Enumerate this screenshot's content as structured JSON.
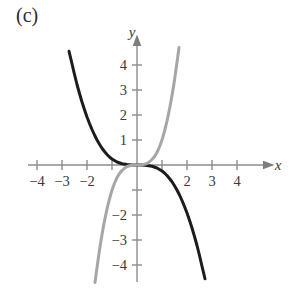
{
  "figure": {
    "panel_label": "(c)",
    "background_color": "#ffffff"
  },
  "chart_data": {
    "type": "line",
    "title": "(c)",
    "xlabel": "x",
    "ylabel": "y",
    "xlim": [
      -4.8,
      5.0
    ],
    "ylim": [
      -4.8,
      4.8
    ],
    "grid": false,
    "legend": null,
    "axes": {
      "x_axis_label": "x",
      "y_axis_label": "y",
      "x_ticks": [
        -4,
        -3,
        -2,
        -1,
        1,
        2,
        3,
        4
      ],
      "x_tick_labels": [
        "-4",
        "-3",
        "-2",
        "",
        "",
        "2",
        "3",
        "4"
      ],
      "x_tick_labels_shown": [
        "-4",
        "-3",
        "-2",
        "2",
        "3",
        "4"
      ],
      "y_ticks": [
        -4,
        -3,
        -2,
        -1,
        1,
        2,
        3,
        4
      ],
      "y_tick_labels": [
        "-4",
        "-3",
        "-2",
        "",
        "1",
        "2",
        "3",
        "4"
      ],
      "y_tick_labels_shown": [
        "1",
        "2",
        "3",
        "4",
        "-2",
        "-3",
        "-4"
      ],
      "x_arrow": true,
      "y_arrow": true,
      "units_per_tick": 1,
      "pixels_per_unit": 25,
      "origin_px": [
        137,
        165
      ]
    },
    "series": [
      {
        "name": "black-curve",
        "color": "#1c1c1c",
        "linewidth": 3.0,
        "description": "decreasing odd-degree curve, flat near origin, falls from upper-left to lower-right",
        "points": [
          [
            -2.72,
            4.55
          ],
          [
            -2.6,
            4.05
          ],
          [
            -2.5,
            3.62
          ],
          [
            -2.4,
            3.22
          ],
          [
            -2.3,
            2.86
          ],
          [
            -2.2,
            2.52
          ],
          [
            -2.1,
            2.21
          ],
          [
            -2.0,
            1.92
          ],
          [
            -1.9,
            1.66
          ],
          [
            -1.8,
            1.42
          ],
          [
            -1.7,
            1.2
          ],
          [
            -1.6,
            1.0
          ],
          [
            -1.5,
            0.83
          ],
          [
            -1.4,
            0.67
          ],
          [
            -1.3,
            0.54
          ],
          [
            -1.2,
            0.42
          ],
          [
            -1.1,
            0.32
          ],
          [
            -1.0,
            0.24
          ],
          [
            -0.9,
            0.18
          ],
          [
            -0.8,
            0.12
          ],
          [
            -0.6,
            0.05
          ],
          [
            -0.4,
            0.02
          ],
          [
            -0.2,
            0.0
          ],
          [
            0.0,
            0.0
          ],
          [
            0.2,
            0.0
          ],
          [
            0.4,
            -0.02
          ],
          [
            0.6,
            -0.05
          ],
          [
            0.8,
            -0.12
          ],
          [
            0.9,
            -0.18
          ],
          [
            1.0,
            -0.24
          ],
          [
            1.1,
            -0.32
          ],
          [
            1.2,
            -0.42
          ],
          [
            1.3,
            -0.54
          ],
          [
            1.4,
            -0.67
          ],
          [
            1.5,
            -0.83
          ],
          [
            1.6,
            -1.0
          ],
          [
            1.7,
            -1.2
          ],
          [
            1.8,
            -1.42
          ],
          [
            1.9,
            -1.66
          ],
          [
            2.0,
            -1.92
          ],
          [
            2.1,
            -2.21
          ],
          [
            2.2,
            -2.52
          ],
          [
            2.3,
            -2.86
          ],
          [
            2.4,
            -3.22
          ],
          [
            2.5,
            -3.62
          ],
          [
            2.6,
            -4.05
          ],
          [
            2.72,
            -4.55
          ]
        ]
      },
      {
        "name": "gray-curve",
        "color": "#a6a6a6",
        "linewidth": 3.0,
        "description": "increasing steep odd-degree curve through origin, rises from lower-left to upper-right",
        "points": [
          [
            -1.68,
            -4.7
          ],
          [
            -1.62,
            -4.25
          ],
          [
            -1.56,
            -3.82
          ],
          [
            -1.5,
            -3.4
          ],
          [
            -1.44,
            -3.02
          ],
          [
            -1.38,
            -2.67
          ],
          [
            -1.32,
            -2.34
          ],
          [
            -1.26,
            -2.04
          ],
          [
            -1.2,
            -1.76
          ],
          [
            -1.14,
            -1.51
          ],
          [
            -1.08,
            -1.28
          ],
          [
            -1.02,
            -1.07
          ],
          [
            -0.96,
            -0.89
          ],
          [
            -0.9,
            -0.73
          ],
          [
            -0.84,
            -0.59
          ],
          [
            -0.78,
            -0.47
          ],
          [
            -0.72,
            -0.37
          ],
          [
            -0.66,
            -0.29
          ],
          [
            -0.6,
            -0.22
          ],
          [
            -0.5,
            -0.13
          ],
          [
            -0.4,
            -0.06
          ],
          [
            -0.3,
            -0.03
          ],
          [
            -0.2,
            -0.01
          ],
          [
            0.0,
            0.0
          ],
          [
            0.2,
            0.01
          ],
          [
            0.3,
            0.03
          ],
          [
            0.4,
            0.06
          ],
          [
            0.5,
            0.13
          ],
          [
            0.6,
            0.22
          ],
          [
            0.66,
            0.29
          ],
          [
            0.72,
            0.37
          ],
          [
            0.78,
            0.47
          ],
          [
            0.84,
            0.59
          ],
          [
            0.9,
            0.73
          ],
          [
            0.96,
            0.89
          ],
          [
            1.02,
            1.07
          ],
          [
            1.08,
            1.28
          ],
          [
            1.14,
            1.51
          ],
          [
            1.2,
            1.76
          ],
          [
            1.26,
            2.04
          ],
          [
            1.32,
            2.34
          ],
          [
            1.38,
            2.67
          ],
          [
            1.44,
            3.02
          ],
          [
            1.5,
            3.4
          ],
          [
            1.56,
            3.82
          ],
          [
            1.62,
            4.25
          ],
          [
            1.68,
            4.7
          ]
        ]
      }
    ]
  },
  "colors": {
    "axis": "#8c8c8c",
    "tick_text": "#3a3a3a",
    "black_curve": "#1c1c1c",
    "gray_curve": "#a6a6a6",
    "background": "#ffffff"
  }
}
